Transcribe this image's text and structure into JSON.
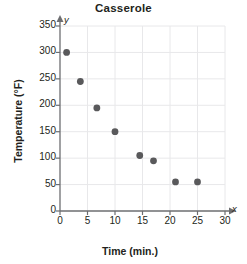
{
  "chart_data": {
    "type": "scatter",
    "title": "Casserole",
    "xlabel": "Time (min.)",
    "ylabel": "Temperature (°F)",
    "x_axis_letter": "x",
    "y_axis_letter": "y",
    "xlim": [
      0,
      30
    ],
    "ylim": [
      0,
      350
    ],
    "grid": true,
    "legend": null,
    "xticks": [
      "0",
      "5",
      "10",
      "15",
      "20",
      "25",
      "30"
    ],
    "yticks": [
      "0",
      "50",
      "100",
      "150",
      "200",
      "250",
      "300",
      "350"
    ],
    "xtick_values": [
      0,
      5,
      10,
      15,
      20,
      25,
      30
    ],
    "ytick_values": [
      0,
      50,
      100,
      150,
      200,
      250,
      300,
      350
    ],
    "series": [
      {
        "name": "Casserole temperature",
        "marker": "circle",
        "color": "#59595b",
        "points": [
          {
            "x": 1.2,
            "y": 300
          },
          {
            "x": 3.7,
            "y": 245
          },
          {
            "x": 6.7,
            "y": 195
          },
          {
            "x": 10.0,
            "y": 150
          },
          {
            "x": 14.5,
            "y": 105
          },
          {
            "x": 17.0,
            "y": 95
          },
          {
            "x": 21.0,
            "y": 55
          },
          {
            "x": 25.0,
            "y": 55
          }
        ]
      }
    ],
    "colors": {
      "marker": "#59595b",
      "axis": "#6d6e71",
      "grid": "#e8e8ea",
      "text": "#231f20",
      "background": "#ffffff"
    }
  }
}
